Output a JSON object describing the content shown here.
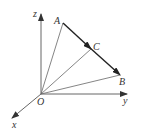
{
  "diagram": {
    "type": "3d-coordinate-vector-diagram",
    "colors": {
      "line": "#555555",
      "vector": "#222222",
      "text": "#333333"
    },
    "axes": {
      "x": {
        "label": "x"
      },
      "y": {
        "label": "y"
      },
      "z": {
        "label": "z"
      }
    },
    "points": {
      "O": {
        "label": "O"
      },
      "A": {
        "label": "A"
      },
      "B": {
        "label": "B"
      },
      "C": {
        "label": "C"
      }
    },
    "segments": [
      "OA",
      "OB",
      "OC",
      "AB"
    ],
    "vectors": [
      "AC",
      "CB"
    ]
  }
}
